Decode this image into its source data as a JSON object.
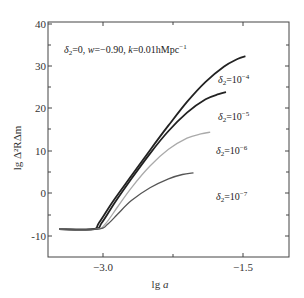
{
  "chart_data": {
    "type": "line",
    "title": "",
    "annotation": "δ2=0, w=-0.90, k=0.01hMpc^-1",
    "xlabel": "lg a",
    "ylabel": "lg Δ_R^2 Δ_m",
    "xlim": [
      -3.6,
      -1.0
    ],
    "ylim": [
      -15,
      40
    ],
    "x_ticks": [
      -3.0,
      -1.5
    ],
    "x_tick_labels": [
      "-3.0",
      "-1.5"
    ],
    "y_ticks": [
      -10,
      0,
      10,
      20,
      30,
      40
    ],
    "y_tick_labels": [
      "-10",
      "0",
      "10",
      "20",
      "30",
      "40"
    ],
    "grid": false,
    "legend_position": "inline labels right of curves",
    "series": [
      {
        "name": "δ2=10^-4",
        "color": "#222222",
        "x": [
          -3.48,
          -3.12,
          -3.05,
          -2.9,
          -2.7,
          -2.5,
          -2.3,
          -2.1,
          -1.9,
          -1.7,
          -1.55,
          -1.47
        ],
        "y": [
          -8.5,
          -8.5,
          -7.0,
          -2.0,
          4.0,
          10.0,
          15.8,
          21.3,
          26.0,
          29.6,
          31.4,
          32.0
        ]
      },
      {
        "name": "δ2=10^-5",
        "color": "#222222",
        "x": [
          -3.48,
          -3.1,
          -3.02,
          -2.88,
          -2.7,
          -2.5,
          -2.3,
          -2.1,
          -1.9,
          -1.76,
          -1.68
        ],
        "y": [
          -8.5,
          -8.5,
          -7.0,
          -2.3,
          3.3,
          9.2,
          14.5,
          18.8,
          21.9,
          23.1,
          23.6
        ]
      },
      {
        "name": "δ2=10^-6",
        "color": "#aaaaaa",
        "x": [
          -3.48,
          -3.08,
          -2.98,
          -2.85,
          -2.7,
          -2.5,
          -2.3,
          -2.1,
          -1.95,
          -1.85
        ],
        "y": [
          -8.5,
          -8.5,
          -7.2,
          -3.3,
          1.2,
          6.3,
          10.2,
          12.8,
          13.8,
          14.2
        ]
      },
      {
        "name": "δ2=10^-7",
        "color": "#555555",
        "x": [
          -3.48,
          -3.06,
          -2.96,
          -2.85,
          -2.7,
          -2.5,
          -2.3,
          -2.15,
          -2.03
        ],
        "y": [
          -8.5,
          -8.5,
          -7.4,
          -5.0,
          -1.8,
          1.2,
          3.3,
          4.3,
          4.7
        ]
      }
    ],
    "labels": [
      {
        "text_main": "δ",
        "sub": "2",
        "rest": "=10",
        "sup": "-4"
      },
      {
        "text_main": "δ",
        "sub": "2",
        "rest": "=10",
        "sup": "-5"
      },
      {
        "text_main": "δ",
        "sub": "2",
        "rest": "=10",
        "sup": "-6"
      },
      {
        "text_main": "δ",
        "sub": "2",
        "rest": "=10",
        "sup": "-7"
      }
    ]
  },
  "axes": {
    "y_ticks": [
      "40",
      "30",
      "20",
      "10",
      "0",
      "-10"
    ],
    "x_ticks": [
      "−3.0",
      "−1.5"
    ],
    "xlabel_main": "lg ",
    "xlabel_var": "a",
    "ylabel": "lg Δ²RΔm"
  },
  "annotation": {
    "delta": "δ",
    "delta_sub": "2",
    "part1": "=0, ",
    "w": "w",
    "part2": "=−0.90, ",
    "k": "k",
    "part3": "=0.01hMpc",
    "sup": "−1"
  },
  "curve_labels": [
    {
      "delta": "δ",
      "sub": "2",
      "eq": "=10",
      "sup": "−4"
    },
    {
      "delta": "δ",
      "sub": "2",
      "eq": "=10",
      "sup": "−5"
    },
    {
      "delta": "δ",
      "sub": "2",
      "eq": "=10",
      "sup": "−6"
    },
    {
      "delta": "δ",
      "sub": "2",
      "eq": "=10",
      "sup": "−7"
    }
  ]
}
